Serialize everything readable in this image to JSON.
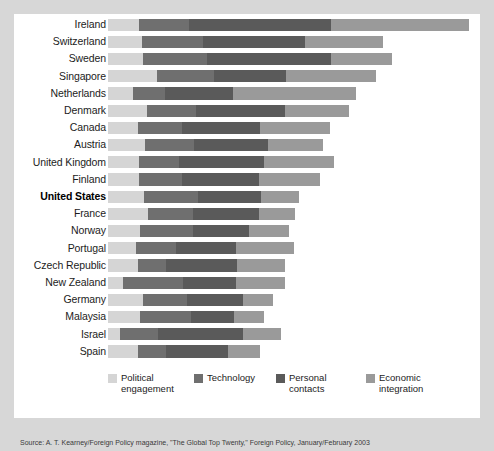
{
  "chart_data": {
    "type": "bar",
    "subtype": "stacked-horizontal",
    "title": "",
    "xlabel": "",
    "ylabel": "",
    "grid": false,
    "legend_position": "bottom",
    "series": [
      {
        "name": "Political engagement",
        "color": "#d5d5d5",
        "values": [
          12.0,
          13.0,
          13.5,
          19.0,
          9.5,
          15.0,
          11.5,
          14.5,
          12.0,
          12.0,
          14.0,
          15.5,
          12.5,
          11.0,
          11.5,
          6.0,
          13.5,
          12.5,
          4.5,
          11.5
        ]
      },
      {
        "name": "Technology",
        "color": "#6f6f6f",
        "values": [
          19.5,
          24.0,
          25.0,
          22.0,
          12.5,
          19.0,
          17.0,
          19.0,
          15.5,
          16.5,
          21.0,
          17.5,
          20.5,
          15.5,
          11.0,
          23.0,
          17.0,
          19.5,
          15.0,
          11.0
        ]
      },
      {
        "name": "Personal contacts",
        "color": "#5a5a5a",
        "values": [
          55.0,
          39.5,
          48.0,
          28.0,
          26.5,
          34.5,
          30.5,
          28.5,
          33.0,
          30.0,
          24.5,
          25.5,
          21.5,
          23.0,
          27.5,
          20.5,
          22.0,
          17.0,
          33.0,
          24.0
        ]
      },
      {
        "name": "Economic integration",
        "color": "#9a9a9a",
        "values": [
          53.5,
          30.0,
          23.5,
          35.0,
          47.5,
          25.0,
          27.0,
          21.5,
          27.0,
          23.5,
          14.5,
          14.0,
          15.5,
          22.5,
          18.5,
          19.0,
          11.5,
          11.5,
          14.5,
          12.5
        ]
      }
    ],
    "categories": [
      "Ireland",
      "Switzerland",
      "Sweden",
      "Singapore",
      "Netherlands",
      "Denmark",
      "Canada",
      "Austria",
      "United Kingdom",
      "Finland",
      "United States",
      "France",
      "Norway",
      "Portugal",
      "Czech Republic",
      "New Zealand",
      "Germany",
      "Malaysia",
      "Israel",
      "Spain"
    ],
    "totals": [
      140.0,
      106.5,
      110.0,
      104.0,
      96.0,
      93.5,
      86.0,
      83.5,
      87.5,
      82.0,
      74.0,
      72.5,
      70.0,
      72.0,
      68.5,
      68.5,
      64.0,
      60.5,
      67.0,
      59.0
    ],
    "highlighted_category": "United States",
    "xlim": [
      0,
      140
    ]
  },
  "legend": {
    "items": [
      {
        "line1": "Political",
        "line2": "engagement",
        "swatch": "s0"
      },
      {
        "line1": "Technology",
        "line2": "",
        "swatch": "s1"
      },
      {
        "line1": "Personal",
        "line2": "contacts",
        "swatch": "s2"
      },
      {
        "line1": "Economic",
        "line2": "integration",
        "swatch": "s3"
      }
    ]
  },
  "caption": {
    "text": "Source: A. T. Kearney/Foreign Policy magazine, \"The Global Top Twenty,\" Foreign Policy, January/February 2003"
  }
}
